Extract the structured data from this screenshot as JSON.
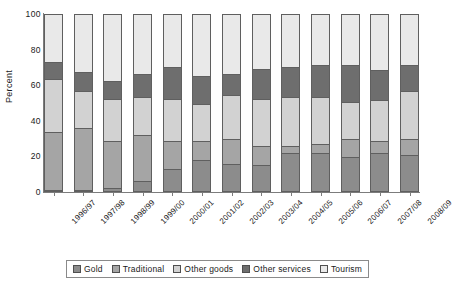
{
  "chart_data": {
    "type": "bar",
    "stacked": true,
    "title": "",
    "subtitle": "",
    "xlabel": "",
    "ylabel": "Percent",
    "ylim": [
      0,
      100
    ],
    "yticks": [
      0,
      20,
      40,
      60,
      80,
      100
    ],
    "grid": false,
    "legend_position": "bottom",
    "categories": [
      "1996/97",
      "1997/98",
      "1998/99",
      "1999/00",
      "2000/01",
      "2001/02",
      "2002/03",
      "2003/04",
      "2004/05",
      "2005/06",
      "2006/07",
      "2007/08",
      "2008/09"
    ],
    "series": [
      {
        "name": "Gold",
        "color": "#8c8c8c",
        "values": [
          0,
          0,
          1,
          5,
          12,
          17,
          15,
          14,
          21,
          21,
          19,
          21,
          20
        ]
      },
      {
        "name": "Traditional",
        "color": "#a5a5a5",
        "values": [
          33,
          35,
          27,
          26,
          16,
          11,
          14,
          11,
          4,
          5,
          10,
          7,
          9
        ]
      },
      {
        "name": "Other goods",
        "color": "#d2d2d2",
        "values": [
          30,
          21,
          24,
          22,
          24,
          21,
          25,
          27,
          28,
          27,
          21,
          23,
          27
        ]
      },
      {
        "name": "Other services",
        "color": "#6e6e6e",
        "values": [
          10,
          11,
          10,
          13,
          18,
          16,
          12,
          17,
          17,
          18,
          21,
          17,
          15
        ]
      },
      {
        "name": "Tourism",
        "color": "#e9e9e9",
        "values": [
          27,
          33,
          38,
          34,
          30,
          35,
          34,
          31,
          30,
          29,
          29,
          32,
          29
        ]
      }
    ]
  },
  "axes": {
    "y_title": "Percent"
  }
}
